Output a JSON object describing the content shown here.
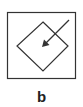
{
  "figure": {
    "label": "b",
    "stroke_color": "#333333",
    "background": "#ffffff",
    "outer_frame": {
      "shape": "square"
    },
    "inner_shape": {
      "shape": "diamond"
    },
    "arrow": {
      "direction": "down-left",
      "points_to": "diamond-center"
    }
  }
}
